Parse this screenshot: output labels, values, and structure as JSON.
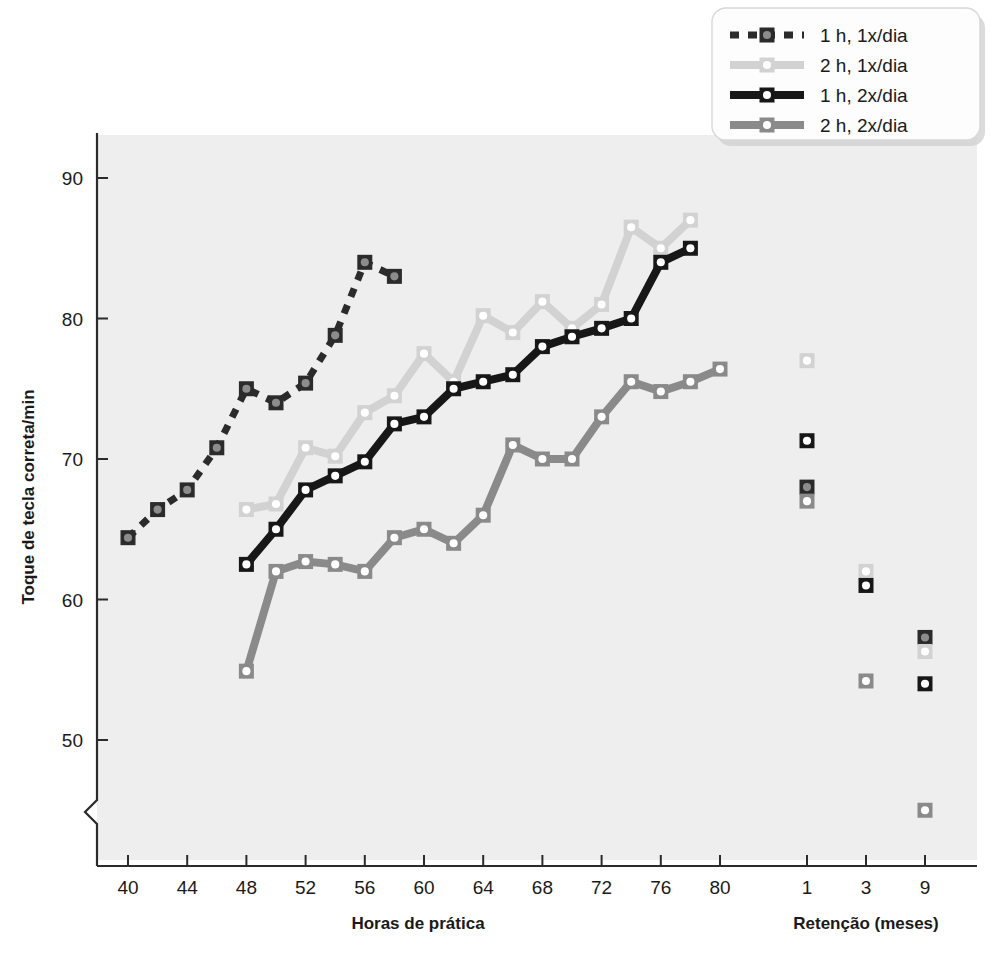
{
  "figure": {
    "background_color": "#ffffff",
    "plot_background_color": "#eeeeee"
  },
  "legend": {
    "position": "top-right",
    "items": [
      {
        "label": "1 h, 1x/dia",
        "color": "#2b2b2b",
        "marker_fill": "#8c8c8c",
        "dash": "dashed"
      },
      {
        "label": "2 h, 1x/dia",
        "color": "#d2d2d2",
        "marker_fill": "#ffffff",
        "dash": "solid"
      },
      {
        "label": "1 h, 2x/dia",
        "color": "#171717",
        "marker_fill": "#ffffff",
        "dash": "solid"
      },
      {
        "label": "2 h, 2x/dia",
        "color": "#8a8a8a",
        "marker_fill": "#ffffff",
        "dash": "solid"
      }
    ]
  },
  "chart_data": {
    "type": "line",
    "title": "",
    "xlabel": "Horas de prática",
    "xlabel_secondary": "Retenção (meses)",
    "ylabel": "Toque de tecla correta/min",
    "ylim": [
      44,
      93
    ],
    "yticks": [
      50,
      60,
      70,
      80,
      90
    ],
    "y_axis_break": true,
    "xlim": [
      38,
      82
    ],
    "xticks": [
      40,
      44,
      48,
      52,
      56,
      60,
      64,
      68,
      72,
      76,
      80
    ],
    "xticks_minor": [
      42,
      46,
      50,
      54,
      58,
      62,
      66,
      70,
      74,
      78
    ],
    "retention_xticks": [
      1,
      3,
      9
    ],
    "grid": false,
    "legend_position": "top-right",
    "series": [
      {
        "name": "1 h, 1x/dia",
        "color": "#2b2b2b",
        "marker_fill": "#8c8c8c",
        "dash": "dashed",
        "x": [
          40,
          42,
          44,
          46,
          48,
          50,
          52,
          54,
          56,
          58
        ],
        "values": [
          64.4,
          66.4,
          67.8,
          70.8,
          75.0,
          74.0,
          75.4,
          78.8,
          84.0,
          83.0
        ],
        "retention_x": [
          1,
          9
        ],
        "retention_values": [
          68.0,
          57.3
        ]
      },
      {
        "name": "2 h, 1x/dia",
        "color": "#d2d2d2",
        "marker_fill": "#ffffff",
        "dash": "solid",
        "x": [
          48,
          50,
          52,
          54,
          56,
          58,
          60,
          62,
          64,
          66,
          68,
          70,
          72,
          74,
          76,
          78
        ],
        "values": [
          66.4,
          66.8,
          70.8,
          70.2,
          73.3,
          74.5,
          77.5,
          75.5,
          80.2,
          79.0,
          81.2,
          79.3,
          81.0,
          86.5,
          85.0,
          87.0
        ],
        "retention_x": [
          1,
          3,
          9
        ],
        "retention_values": [
          77.0,
          62.0,
          56.3
        ]
      },
      {
        "name": "1 h, 2x/dia",
        "color": "#171717",
        "marker_fill": "#ffffff",
        "dash": "solid",
        "x": [
          48,
          50,
          52,
          54,
          56,
          58,
          60,
          62,
          64,
          66,
          68,
          70,
          72,
          74,
          76,
          78
        ],
        "values": [
          62.5,
          65.0,
          67.8,
          68.8,
          69.8,
          72.5,
          73.0,
          75.0,
          75.5,
          76.0,
          78.0,
          78.7,
          79.3,
          80.0,
          84.0,
          85.0
        ],
        "retention_x": [
          1,
          3,
          9
        ],
        "retention_values": [
          71.3,
          61.0,
          54.0
        ]
      },
      {
        "name": "2 h, 2x/dia",
        "color": "#8a8a8a",
        "marker_fill": "#ffffff",
        "dash": "solid",
        "x": [
          48,
          50,
          52,
          54,
          56,
          58,
          60,
          62,
          64,
          66,
          68,
          70,
          72,
          74,
          76,
          78,
          80
        ],
        "values": [
          54.9,
          62.0,
          62.7,
          62.5,
          62.0,
          64.4,
          65.0,
          64.0,
          66.0,
          71.0,
          70.0,
          70.0,
          73.0,
          75.5,
          74.8,
          75.5,
          76.4
        ],
        "retention_x": [
          1,
          3,
          9
        ],
        "retention_values": [
          67.0,
          54.2,
          45.0
        ]
      }
    ]
  },
  "caption": {
    "text": ""
  }
}
